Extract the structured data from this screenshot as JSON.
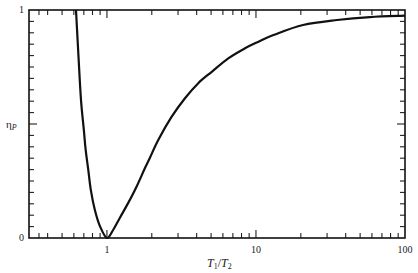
{
  "chart_data": {
    "type": "line",
    "title": "",
    "xlabel": "T1/T2",
    "ylabel": "ηP",
    "xscale": "log",
    "yscale": "linear",
    "xlim": [
      0.3,
      100
    ],
    "ylim": [
      0,
      1
    ],
    "grid": false,
    "legend": null,
    "x_ticks": {
      "labeled": [
        1,
        10,
        100
      ],
      "labels": [
        "1",
        "10",
        "100"
      ],
      "major": [
        1,
        10
      ],
      "minor": [
        0.35,
        0.4,
        0.5,
        0.6,
        0.7,
        0.8,
        0.9,
        2,
        3,
        4,
        5,
        6,
        7,
        8,
        9,
        20,
        30,
        40,
        50,
        60,
        70,
        80,
        90
      ]
    },
    "y_ticks": {
      "labeled": [
        0,
        1
      ],
      "labels": [
        "0",
        "1"
      ],
      "major": [
        0.5
      ],
      "minor": [
        0.05,
        0.1,
        0.15,
        0.2,
        0.25,
        0.3,
        0.35,
        0.4,
        0.45,
        0.55,
        0.6,
        0.65,
        0.7,
        0.75,
        0.8,
        0.85,
        0.9,
        0.95
      ]
    },
    "series": [
      {
        "name": "ηP",
        "color": "#111111",
        "x": [
          0.62,
          0.644,
          0.67,
          0.7,
          0.72,
          0.75,
          0.78,
          0.83,
          0.9,
          1.0,
          1.1,
          1.22,
          1.39,
          1.58,
          1.8,
          1.94,
          2.21,
          2.72,
          3.34,
          4.1,
          5.05,
          6.52,
          8.44,
          10.4,
          13.1,
          20.7,
          35.0,
          58.2,
          100
        ],
        "y": [
          1.0,
          0.8,
          0.605,
          0.474,
          0.386,
          0.298,
          0.21,
          0.123,
          0.05,
          0.0,
          0.035,
          0.088,
          0.154,
          0.225,
          0.307,
          0.351,
          0.43,
          0.532,
          0.613,
          0.679,
          0.729,
          0.788,
          0.832,
          0.861,
          0.89,
          0.934,
          0.956,
          0.969,
          0.975
        ]
      }
    ]
  },
  "axis_display": {
    "x_title": {
      "main1": "T",
      "sub1": "1",
      "sep": "/",
      "main2": "T",
      "sub2": "2"
    },
    "y_title": {
      "main": "η",
      "sub": "P"
    }
  }
}
